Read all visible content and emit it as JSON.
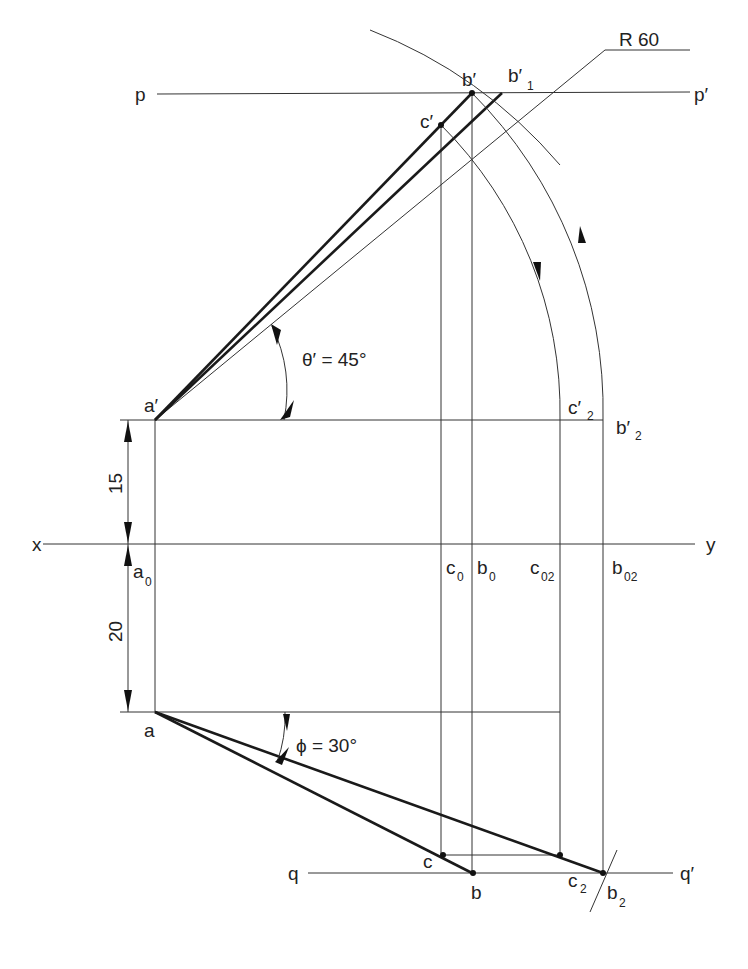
{
  "diagram": {
    "type": "orthographic projection of line (true length / inclination construction)",
    "labels": {
      "p": "p",
      "p_prime": "p′",
      "q": "q",
      "q_prime": "q′",
      "x": "x",
      "y": "y",
      "a_prime": "a′",
      "b_prime": "b′",
      "b_prime_1": "b′",
      "b_prime_1_sub": "1",
      "c_prime": "c′",
      "c_prime_2": "c′",
      "c_prime_2_sub": "2",
      "b_prime_2": "b′",
      "b_prime_2_sub": "2",
      "a0": "a",
      "a0_sub": "0",
      "c0": "c",
      "c0_sub": "0",
      "b0": "b",
      "b0_sub": "0",
      "c02": "c",
      "c02_sub": "02",
      "b02": "b",
      "b02_sub": "02",
      "a": "a",
      "b": "b",
      "c": "c",
      "c2": "c",
      "c2_sub": "2",
      "b2": "b",
      "b2_sub": "2",
      "radius": "R 60",
      "theta": "θ′ = 45°",
      "phi": "ϕ = 30°",
      "dim_15": "15",
      "dim_20": "20"
    },
    "colors": {
      "line": "#333333",
      "thick_line": "#1a1a1a",
      "background": "#ffffff"
    }
  }
}
